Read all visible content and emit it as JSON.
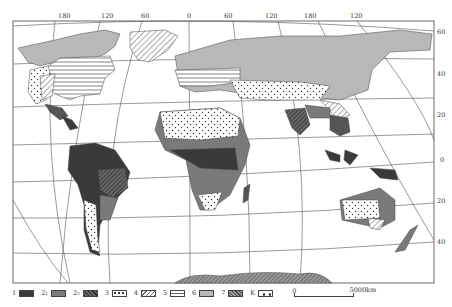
{
  "map": {
    "title": "World map of climate/vegetation zones",
    "top_longitude_labels": [
      "180",
      "120",
      "60",
      "0",
      "60",
      "120",
      "180",
      "120"
    ],
    "right_latitude_labels": [
      "60",
      "40",
      "20",
      "0",
      "20",
      "40"
    ],
    "colors": {
      "type1": "#3a3a3a",
      "type2_1": "#7a7a7a",
      "type2_2": "#555555",
      "type6": "#b8b8b8",
      "background": "#ffffff",
      "grid": "#555555"
    }
  },
  "legend": {
    "items": [
      {
        "id": "1",
        "label": "1",
        "pattern": "solid-dark"
      },
      {
        "id": "2_1",
        "label": "2₁",
        "pattern": "solid-medium"
      },
      {
        "id": "2_2",
        "label": "2₂",
        "pattern": "dark-hatched"
      },
      {
        "id": "3",
        "label": "3",
        "pattern": "dotted"
      },
      {
        "id": "4",
        "label": "4",
        "pattern": "diagonal-hatch"
      },
      {
        "id": "5",
        "label": "5",
        "pattern": "horizontal-lines"
      },
      {
        "id": "6",
        "label": "6",
        "pattern": "solid-light"
      },
      {
        "id": "7",
        "label": "7",
        "pattern": "dense-hatch"
      },
      {
        "id": "K",
        "label": "K",
        "pattern": "sparse-dots"
      }
    ],
    "scale": {
      "start": "0",
      "end": "5000km"
    }
  }
}
